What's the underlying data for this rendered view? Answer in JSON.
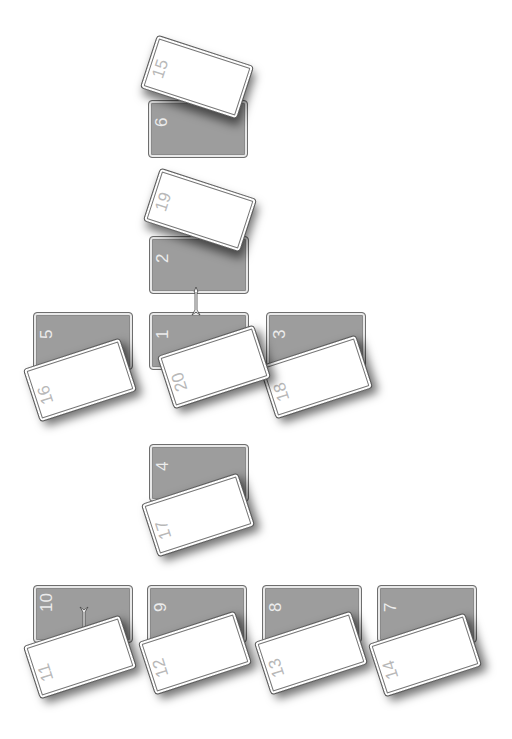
{
  "game": {
    "type": "card-stacking-puzzle",
    "colors": {
      "background": "#ffffff",
      "gray_card": "#9d9d9d",
      "white_card": "#ffffff",
      "gray_label": "#ececec",
      "white_label": "#b8b8b8"
    },
    "gray_cards": [
      {
        "id": "6",
        "label": "6",
        "x": 148,
        "y": 100
      },
      {
        "id": "2",
        "label": "2",
        "x": 149,
        "y": 236
      },
      {
        "id": "5",
        "label": "5",
        "x": 33,
        "y": 312
      },
      {
        "id": "1",
        "label": "1",
        "x": 149,
        "y": 312
      },
      {
        "id": "3",
        "label": "3",
        "x": 266,
        "y": 312
      },
      {
        "id": "4",
        "label": "4",
        "x": 149,
        "y": 444
      },
      {
        "id": "10",
        "label": "10",
        "x": 33,
        "y": 585
      },
      {
        "id": "9",
        "label": "9",
        "x": 147,
        "y": 585
      },
      {
        "id": "8",
        "label": "8",
        "x": 262,
        "y": 585
      },
      {
        "id": "7",
        "label": "7",
        "x": 377,
        "y": 585
      }
    ],
    "white_cards": [
      {
        "id": "15",
        "label": "15",
        "cx": 197,
        "cy": 77,
        "angle": 18
      },
      {
        "id": "19",
        "label": "19",
        "cx": 200,
        "cy": 210,
        "angle": 18
      },
      {
        "id": "16",
        "label": "16",
        "cx": 80,
        "cy": 380,
        "angle": -18
      },
      {
        "id": "18",
        "label": "18",
        "cx": 316,
        "cy": 377,
        "angle": -18
      },
      {
        "id": "20",
        "label": "20",
        "cx": 214,
        "cy": 367,
        "angle": -18
      },
      {
        "id": "17",
        "label": "17",
        "cx": 198,
        "cy": 515,
        "angle": -18
      },
      {
        "id": "11",
        "label": "11",
        "cx": 80,
        "cy": 657,
        "angle": -18
      },
      {
        "id": "12",
        "label": "12",
        "cx": 195,
        "cy": 653,
        "angle": -18
      },
      {
        "id": "13",
        "label": "13",
        "cx": 311,
        "cy": 653,
        "angle": -18
      },
      {
        "id": "14",
        "label": "14",
        "cx": 425,
        "cy": 655,
        "angle": -18
      }
    ],
    "arrows": [
      {
        "id": "arrow-2-to-1",
        "x": 191,
        "y": 288,
        "direction": "down"
      },
      {
        "id": "arrow-10-to-11",
        "x": 79,
        "y": 608,
        "direction": "down"
      }
    ]
  },
  "labels": {
    "g6": "6",
    "g2": "2",
    "g5": "5",
    "g1": "1",
    "g3": "3",
    "g4": "4",
    "g10": "10",
    "g9": "9",
    "g8": "8",
    "g7": "7",
    "w15": "15",
    "w19": "19",
    "w16": "16",
    "w18": "18",
    "w20": "20",
    "w17": "17",
    "w11": "11",
    "w12": "12",
    "w13": "13",
    "w14": "14"
  }
}
